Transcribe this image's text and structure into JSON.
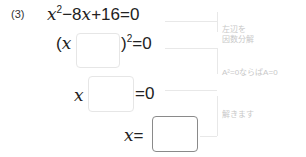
{
  "problem": {
    "number": "(3)",
    "equation": {
      "x": "x",
      "exp": "2",
      "rest": "−8",
      "x2": "x",
      "tail": "+16=0"
    }
  },
  "steps": [
    {
      "open": "(",
      "var": "x",
      "close": ")",
      "exp": "2",
      "rhs": "=0"
    },
    {
      "var": "x",
      "rhs": "=0"
    },
    {
      "var": "x",
      "eq": "="
    }
  ],
  "notes": [
    {
      "line1": "左辺を",
      "line2": "因数分解"
    },
    {
      "line1": "A²=0ならばA=0"
    },
    {
      "line1": "解きます"
    }
  ]
}
